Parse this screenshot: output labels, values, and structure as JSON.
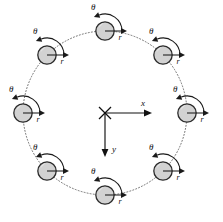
{
  "figure": {
    "type": "diagram",
    "background_color": "#ffffff",
    "canvas": {
      "width": 223,
      "height": 222
    }
  },
  "ring": {
    "name": "particle-ring",
    "center": {
      "x": 105,
      "y": 113
    },
    "radius": 82,
    "line_style": "dotted",
    "line_color": "#6e6e6e",
    "particle_count": 8
  },
  "particle_style": {
    "radius": 9.2,
    "fill_color": "#d2d2d2",
    "stroke_color": "#2b2b2b"
  },
  "labels": {
    "theta": "θ",
    "r": "r",
    "x_axis": "x",
    "y_axis": "y"
  },
  "axes": {
    "name": "coordinate-axes",
    "origin": {
      "x": 105,
      "y": 113
    },
    "origin_marker": "x-cross",
    "x": {
      "label": "x",
      "direction": "right",
      "length": 47
    },
    "y": {
      "label": "y",
      "direction": "down",
      "length": 44
    }
  },
  "particles": [
    {
      "id": 1,
      "angle_deg": 270,
      "cx": 105,
      "cy": 31,
      "theta_label": "θ",
      "r_label": "r"
    },
    {
      "id": 2,
      "angle_deg": 315,
      "cx": 163,
      "cy": 55,
      "theta_label": "θ",
      "r_label": "r"
    },
    {
      "id": 3,
      "angle_deg": 0,
      "cx": 187,
      "cy": 113,
      "theta_label": "θ",
      "r_label": "r"
    },
    {
      "id": 4,
      "angle_deg": 45,
      "cx": 163,
      "cy": 171,
      "theta_label": "θ",
      "r_label": "r"
    },
    {
      "id": 5,
      "angle_deg": 90,
      "cx": 105,
      "cy": 195,
      "theta_label": "θ",
      "r_label": "r"
    },
    {
      "id": 6,
      "angle_deg": 135,
      "cx": 47,
      "cy": 171,
      "theta_label": "θ",
      "r_label": "r"
    },
    {
      "id": 7,
      "angle_deg": 180,
      "cx": 23,
      "cy": 113,
      "theta_label": "θ",
      "r_label": "r"
    },
    {
      "id": 8,
      "angle_deg": 225,
      "cx": 47,
      "cy": 55,
      "theta_label": "θ",
      "r_label": "r"
    }
  ],
  "annotation_geometry": {
    "r_arrow_length": 22,
    "theta_arc_radius": 17,
    "theta_label_offset": {
      "dx": -9,
      "dy": -23
    },
    "r_label_offset": {
      "dx": 15,
      "dy": 7
    }
  }
}
